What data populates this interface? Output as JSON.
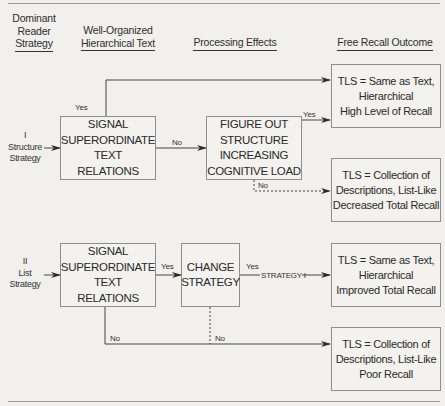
{
  "headers": {
    "dominant_strategy": [
      "Dominant",
      "Reader",
      "Strategy"
    ],
    "text": [
      "Well-Organized",
      "Hierarchical Text"
    ],
    "processing": "Processing Effects",
    "outcome": "Free Recall Outcome"
  },
  "strategies": {
    "structure": {
      "numeral": "I",
      "line1": "Structure",
      "line2": "Strategy"
    },
    "list": {
      "numeral": "II",
      "line1": "List",
      "line2": "Strategy"
    }
  },
  "boxes": {
    "signal_1": [
      "SIGNAL",
      "SUPERORDINATE",
      "TEXT",
      "RELATIONS"
    ],
    "figure_out": [
      "FIGURE OUT",
      "STRUCTURE",
      "INCREASING",
      "COGNITIVE LOAD"
    ],
    "signal_2": [
      "SIGNAL",
      "SUPERORDINATE",
      "TEXT",
      "RELATIONS"
    ],
    "change_strategy": [
      "CHANGE",
      "STRATEGY"
    ]
  },
  "outcomes": [
    [
      "TLS = Same as Text,",
      "Hierarchical",
      "High Level of Recall"
    ],
    [
      "TLS = Collection of",
      "Descriptions, List-Like",
      "Decreased Total Recall"
    ],
    [
      "TLS = Same as Text,",
      "Hierarchical",
      "Improved Total Recall"
    ],
    [
      "TLS = Collection of",
      "Descriptions, List-Like",
      "Poor Recall"
    ]
  ],
  "edge_labels": {
    "yes_top": "Yes",
    "no_1": "No",
    "yes_figure": "Yes",
    "no_figure": "No",
    "yes_signal_2": "Yes",
    "yes_change": "Yes",
    "strategy_i": "STRATEGY I",
    "no_signal_2": "No",
    "no_change": "No"
  }
}
